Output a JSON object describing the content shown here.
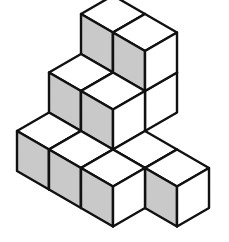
{
  "diagram": {
    "type": "isometric-cube-stack",
    "colors": {
      "shaded_face": "#c9c9c9",
      "light_face": "#ffffff",
      "edge": "#111111"
    },
    "cubes": [
      {
        "x": 0,
        "y": 1,
        "z": 2
      },
      {
        "x": 1,
        "y": 1,
        "z": 2
      },
      {
        "x": 1,
        "y": 1,
        "z": 1
      },
      {
        "x": 0,
        "y": 2,
        "z": 1
      },
      {
        "x": 1,
        "y": 2,
        "z": 1
      },
      {
        "x": 0,
        "y": 3,
        "z": 0
      },
      {
        "x": 1,
        "y": 3,
        "z": 0
      },
      {
        "x": 2,
        "y": 2,
        "z": 0
      },
      {
        "x": 3,
        "y": 2,
        "z": 0
      },
      {
        "x": 2,
        "y": 3,
        "z": 0
      }
    ]
  }
}
